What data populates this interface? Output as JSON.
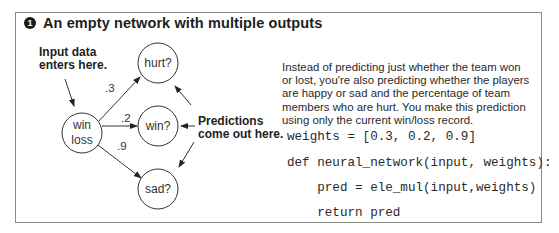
{
  "figure": {
    "number": "1",
    "title": "An empty network with multiple outputs"
  },
  "diagram": {
    "input_node": {
      "line1": "win",
      "line2": "loss"
    },
    "output_nodes": [
      {
        "label": "hurt?",
        "weight": ".3"
      },
      {
        "label": "win?",
        "weight": ".2"
      },
      {
        "label": "sad?",
        "weight": ".9"
      }
    ],
    "input_callout": {
      "line1": "Input data",
      "line2": "enters here."
    },
    "output_callout": {
      "line1": "Predictions",
      "line2": "come out here."
    }
  },
  "description": "Instead of predicting just whether the team won or lost, you're also predicting whether the players are happy or sad and the percentage of team members who are hurt. You make this prediction using only the current win/loss record.",
  "code": {
    "lines": [
      "weights = [0.3, 0.2, 0.9]",
      "def neural_network(input, weights):",
      "    pred = ele_mul(input,weights)",
      "    return pred"
    ]
  }
}
